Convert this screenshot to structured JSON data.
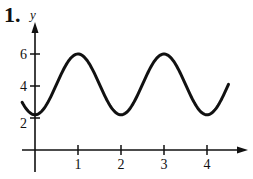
{
  "problem_number": "1.",
  "chart_data": {
    "type": "line",
    "title": "",
    "xlabel": "",
    "ylabel": "y",
    "x_ticks": [
      1,
      2,
      3,
      4
    ],
    "y_ticks": [
      2,
      4,
      6
    ],
    "xlim": [
      -0.3,
      4.9
    ],
    "ylim": [
      0,
      7.5
    ],
    "grid": false,
    "legend": null,
    "series": [
      {
        "name": "curve",
        "description": "sinusoid with maxima 6 at x=1 and x=3, minima ~2.2 at x=0, x=2, x=4",
        "x": [
          -0.3,
          0,
          0.5,
          1,
          1.5,
          2,
          2.5,
          3,
          3.5,
          4,
          4.5
        ],
        "y": [
          3.0,
          2.2,
          4.1,
          6.0,
          4.1,
          2.2,
          4.1,
          6.0,
          4.1,
          2.2,
          5.2
        ]
      }
    ]
  }
}
